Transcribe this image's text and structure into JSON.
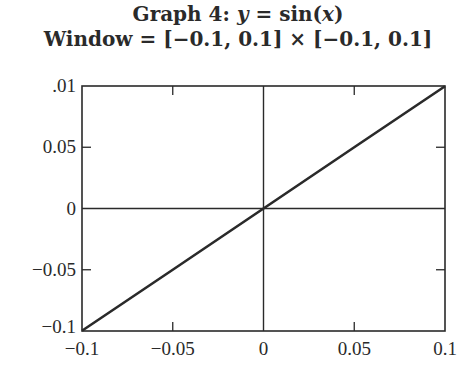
{
  "title": {
    "line1_prefix": "Graph 4: ",
    "line1_y": "y",
    "line1_eq": " = sin(",
    "line1_x": "x",
    "line1_suffix": ")",
    "line2": "Window = [−0.1, 0.1] × [−0.1, 0.1]"
  },
  "chart_data": {
    "type": "line",
    "title": "Graph 4: y = sin(x)",
    "subtitle": "Window = [-0.1, 0.1] × [-0.1, 0.1]",
    "xlabel": "",
    "ylabel": "",
    "xlim": [
      -0.1,
      0.1
    ],
    "ylim": [
      -0.1,
      0.1
    ],
    "grid": false,
    "axes_through_origin": true,
    "x_ticks": [
      -0.1,
      -0.05,
      0,
      0.05,
      0.1
    ],
    "x_tick_labels": [
      "−0.1",
      "−0.05",
      "0",
      "0.05",
      "0.1"
    ],
    "y_ticks": [
      -0.1,
      -0.05,
      0,
      0.05,
      0.1
    ],
    "y_tick_labels": [
      "−0.1",
      "−0.05",
      "0",
      "0.05",
      ".01"
    ],
    "series": [
      {
        "name": "sin(x)",
        "x": [
          -0.1,
          -0.05,
          0,
          0.05,
          0.1
        ],
        "y": [
          -0.0998,
          -0.05,
          0,
          0.05,
          0.0998
        ]
      }
    ],
    "line_color": "#2a2a2a"
  }
}
